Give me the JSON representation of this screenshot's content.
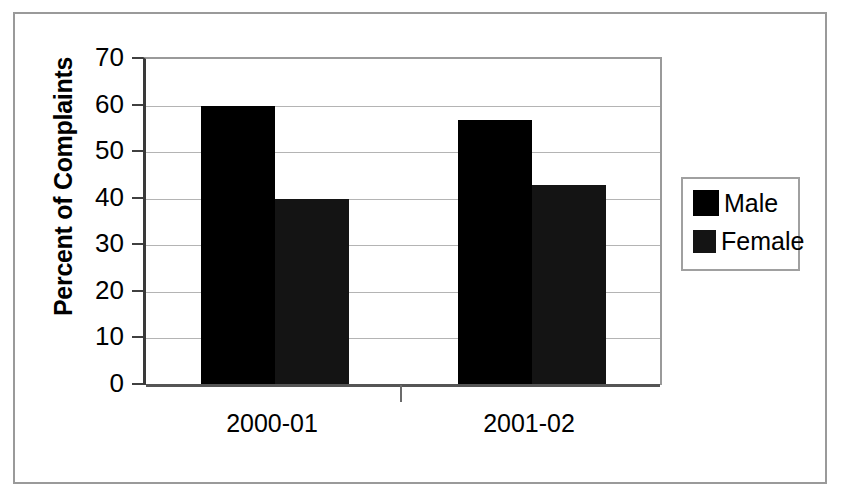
{
  "chart_data": {
    "type": "bar",
    "title": "",
    "subtitle": "",
    "xlabel": "",
    "ylabel": "Percent of Complaints",
    "categories": [
      "2000-01",
      "2001-02"
    ],
    "series": [
      {
        "name": "Male",
        "values": [
          60,
          57
        ],
        "color": "#000000"
      },
      {
        "name": "Female",
        "values": [
          40,
          43
        ],
        "color": "#141414"
      }
    ],
    "ylim": [
      0,
      70
    ],
    "yticks": [
      0,
      10,
      20,
      30,
      40,
      50,
      60,
      70
    ],
    "ytick_labels": [
      "0",
      "10",
      "20",
      "30",
      "40",
      "50",
      "60",
      "70"
    ],
    "grid": true,
    "grid_axis": "y",
    "legend_position": "right",
    "background_color": "#ffffff",
    "frame_color": "#9a9a9a",
    "gridline_color": "#b4b4b4",
    "axis_color": "#3a3a3a"
  },
  "legend": {
    "entries": [
      {
        "label": "Male",
        "swatch_color": "#000000",
        "swatch_size": 26
      },
      {
        "label": "Female",
        "swatch_color": "#141414",
        "swatch_size": 23
      }
    ]
  },
  "axes": {
    "y_title": "Percent of Complaints",
    "y_tick_labels": [
      "70",
      "60",
      "50",
      "40",
      "30",
      "20",
      "10",
      "0"
    ],
    "x_tick_labels": [
      "2000-01",
      "2001-02"
    ]
  }
}
